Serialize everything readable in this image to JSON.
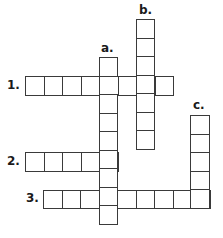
{
  "puzzle": {
    "type": "crossword",
    "cell_size": 18.5,
    "border_color": "#3a3a3a",
    "labels": {
      "across_1": "1.",
      "across_2": "2.",
      "across_3": "3.",
      "down_a": "a.",
      "down_b": "b.",
      "down_c": "c."
    },
    "entries": [
      {
        "id": "1",
        "direction": "across",
        "x": 25,
        "y": 76,
        "length": 8
      },
      {
        "id": "2",
        "direction": "across",
        "x": 25,
        "y": 152,
        "length": 5
      },
      {
        "id": "3",
        "direction": "across",
        "x": 43,
        "y": 189.5,
        "length": 9
      },
      {
        "id": "a",
        "direction": "down",
        "x": 98.5,
        "y": 57,
        "length": 9
      },
      {
        "id": "b",
        "direction": "down",
        "x": 135.5,
        "y": 19,
        "length": 7
      },
      {
        "id": "c",
        "direction": "down",
        "x": 190,
        "y": 115,
        "length": 5
      }
    ]
  }
}
